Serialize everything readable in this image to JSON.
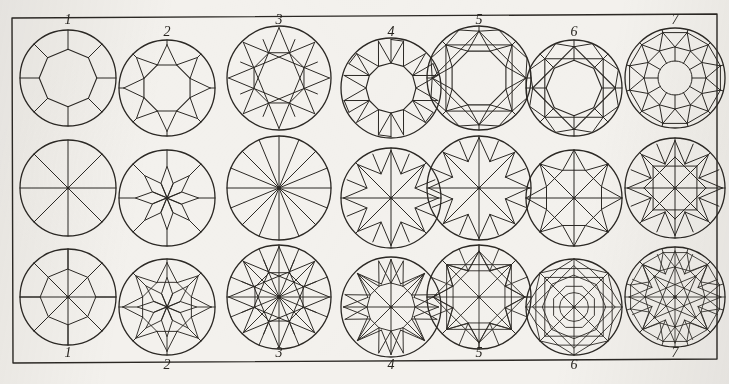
{
  "figure": {
    "kind": "gemstone-facet-diagram-plate",
    "background_color": "#f3f1ed",
    "ink_color": "#2b2824",
    "border": {
      "visible": true,
      "color": "#2b2824",
      "width": 1.4
    },
    "columns": 7,
    "rows": 3,
    "row_descriptions": [
      "crown (top) facet layouts",
      "pavilion (bottom) facet layouts",
      "superimposed crown and pavilion layouts"
    ],
    "top_labels": [
      "1",
      "2",
      "3",
      "4",
      "5",
      "6",
      "7"
    ],
    "bottom_labels": [
      "1",
      "2",
      "3",
      "4",
      "5",
      "6",
      "7"
    ],
    "label_style": "italic serif numerals, staggered high/low"
  },
  "layout": {
    "frame": {
      "x": 12,
      "y": 14,
      "width": 705,
      "height": 349
    },
    "column_centers": [
      68,
      167,
      279,
      391,
      479,
      574,
      675
    ],
    "top_label_y": [
      24,
      36,
      24,
      36,
      24,
      36,
      24
    ],
    "bottom_label_y": [
      357,
      369,
      357,
      369,
      357,
      369,
      357
    ],
    "row_centers": [
      78,
      188,
      297
    ],
    "row_offsets_y": [
      0,
      10,
      0,
      10,
      0,
      10,
      0
    ],
    "radii": [
      48,
      48,
      52,
      50,
      52,
      48,
      50
    ]
  },
  "patterns": [
    {
      "index": 1,
      "name": "eight-cut",
      "crown": "outer circle, inner octagon table, eight radial girdle lines",
      "pavilion": "eight radial spokes from culet",
      "combined": "octagon plus eight spokes within circle",
      "facet_counts": {
        "crown_main": 8,
        "pavilion_main": 8
      }
    },
    {
      "index": 2,
      "name": "star-cut",
      "crown": "eight pointed star over inner octagon table",
      "pavilion": "eight elongated petal facets around culet",
      "combined": "star overlaid on petal rosette",
      "facet_counts": {
        "crown_main": 16,
        "pavilion_main": 8
      }
    },
    {
      "index": 3,
      "name": "swiss-cut",
      "crown": "interlaced octagram with scalloped girdle",
      "pavilion": "sixteen narrow radial wedges from culet",
      "combined": "interlaced octagram over sixteen wedges",
      "facet_counts": {
        "crown_main": 16,
        "pavilion_main": 16
      }
    },
    {
      "index": 4,
      "name": "twelve-main-cut",
      "crown": "dodecagon table with twelve kite facets",
      "pavilion": "eight arrow facets radiating from culet",
      "combined": "kite crown overlaid on arrow pavilion",
      "facet_counts": {
        "crown_main": 12,
        "pavilion_main": 8
      }
    },
    {
      "index": 5,
      "name": "brilliant-cut",
      "crown": "octagonal table, eight bezel kites, sixteen girdle facets",
      "pavilion": "eight pavilion mains with arrow step facets",
      "combined": "full round brilliant superimposition",
      "facet_counts": {
        "crown_main": 24,
        "pavilion_main": 16
      }
    },
    {
      "index": 6,
      "name": "modified-brilliant-cut",
      "crown": "octagon table with rotated square and star points",
      "pavilion": "eight mains plus split girdle facets",
      "combined": "concentric octagon lattice",
      "facet_counts": {
        "crown_main": 24,
        "pavilion_main": 16
      }
    },
    {
      "index": 7,
      "name": "king-cut",
      "crown": "small round table ringed by triangular star facets",
      "pavilion": "twelve mains with chevron girdle facets",
      "combined": "dense interlaced facet network",
      "facet_counts": {
        "crown_main": 32,
        "pavilion_main": 24
      }
    }
  ]
}
